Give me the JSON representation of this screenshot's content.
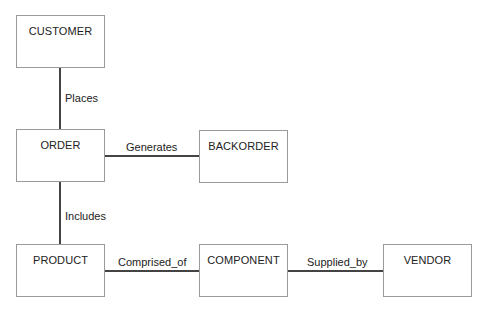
{
  "diagram": {
    "type": "entity-relationship",
    "entities": [
      {
        "id": "customer",
        "label": "CUSTOMER"
      },
      {
        "id": "order",
        "label": "ORDER"
      },
      {
        "id": "backorder",
        "label": "BACKORDER"
      },
      {
        "id": "product",
        "label": "PRODUCT"
      },
      {
        "id": "component",
        "label": "COMPONENT"
      },
      {
        "id": "vendor",
        "label": "VENDOR"
      }
    ],
    "relationships": [
      {
        "from": "customer",
        "to": "order",
        "label": "Places"
      },
      {
        "from": "order",
        "to": "backorder",
        "label": "Generates"
      },
      {
        "from": "order",
        "to": "product",
        "label": "Includes"
      },
      {
        "from": "product",
        "to": "component",
        "label": "Comprised_of"
      },
      {
        "from": "component",
        "to": "vendor",
        "label": "Supplied_by"
      }
    ]
  },
  "colors": {
    "line": "#444444",
    "box_border": "#9a9a9a",
    "text": "#222222"
  }
}
